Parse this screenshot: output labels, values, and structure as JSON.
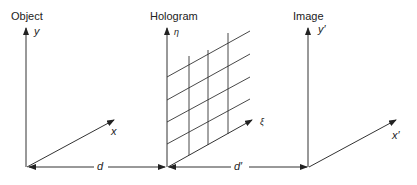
{
  "planes": [
    {
      "title": "Object",
      "vertical_axis": "y",
      "horizontal_axis": "x"
    },
    {
      "title": "Hologram",
      "vertical_axis": "η",
      "horizontal_axis": "ξ"
    },
    {
      "title": "Image",
      "vertical_axis": "y′",
      "horizontal_axis": "x′"
    }
  ],
  "distances": {
    "object_to_hologram": "d",
    "hologram_to_image": "d′"
  },
  "colors": {
    "line": "#333333",
    "background": "#ffffff"
  }
}
